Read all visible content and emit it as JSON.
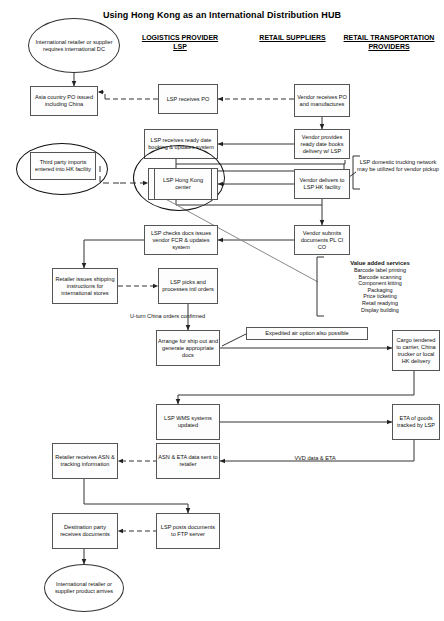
{
  "diagram": {
    "title": "Using Hong Kong as an International Distribution HUB",
    "columns": [
      {
        "id": "logistics-provider",
        "label": "LOGISTICS PROVIDER\nLSP"
      },
      {
        "id": "retail-suppliers",
        "label": "RETAIL SUPPLIERS"
      },
      {
        "id": "retail-transportation-providers",
        "label": "RETAIL TRANSPORTATION\nPROVIDERS"
      }
    ],
    "column_labels": {
      "logistics_line1": "LOGISTICS PROVIDER",
      "logistics_line2": "LSP",
      "retail_suppliers": "RETAIL SUPPLIERS",
      "retail_transport_line1": "RETAIL TRANSPORTATION",
      "retail_transport_line2": "PROVIDERS"
    },
    "nodes": {
      "start_ellipse": "International retailer or supplier requires international DC",
      "asia_country_po": "Asia country PO issued including China",
      "lsp_receives_po": "LSP receives PO",
      "vendor_receives_po": "Vendor receives PO and manufactures",
      "lsp_receives_ready_date": "LSP receives ready date booking & updates system",
      "vendor_provides_ready_date": "Vendor provides ready date books delivery w/ LSP",
      "third_party_imports": "Third party imports entered into HK facility",
      "lsp_hong_kong_center": "LSP Hong Kong center",
      "vendor_delivers": "Vendor delivers to LSP HK facility",
      "lsp_checks_docs": "LSP checks docs issues vendor FCR & updates system",
      "vendor_submits_documents": "Vendor submits documents PL CI CO",
      "retailer_issues_shipping": "Retailer issues shipping instructions for international stores",
      "lsp_picks_processes": "LSP picks and processes intl orders",
      "arrange_for_ship_out": "Arrange for ship out and generate appropriate docs",
      "cargo_tendered": "Cargo tendered to carrier, China trucker or local HK delivery",
      "lsp_wms_updated": "LSP WMS systems updated",
      "eta_of_goods": "ETA of goods tracked by LSP",
      "retailer_receives_asn": "Retailer receives ASN & tracking information",
      "asn_eta_data_sent": "ASN & ETA data sent to retailer",
      "destination_party": "Destination party receives documents",
      "lsp_posts_documents": "LSP posts documents to FTP server",
      "end_ellipse": "International retailer or supplier product arrives"
    },
    "notes": {
      "lsp_domestic_trucking": "LSP domestic trucking network may be utilized for vendor pickup",
      "expedited_air": "Expedited air option also possible",
      "u_turn_china": "U-turn China orders confirmed",
      "vvd_data_eta": "VVD data & ETA"
    },
    "value_added_services": {
      "title": "Value added services",
      "items": [
        "Barcode label printing",
        "Barcode scanning",
        "Component kitting",
        "Packaging",
        "Price ticketing",
        "Retail readying",
        "Display building"
      ]
    },
    "colors": {
      "background": "#ffffff",
      "node_border": "#555555",
      "node_fill": "#fdfdfd",
      "line": "#333333",
      "text": "#111111"
    }
  }
}
